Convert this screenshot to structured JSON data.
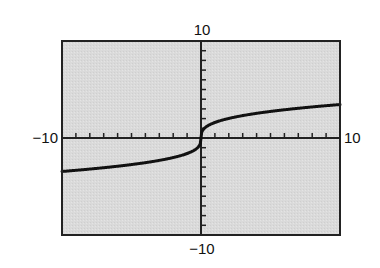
{
  "chart_data": {
    "type": "line",
    "title": "",
    "xlabel": "",
    "ylabel": "",
    "xlim": [
      -10,
      10
    ],
    "ylim": [
      -10,
      10
    ],
    "xscale_ticks": 1,
    "yscale_ticks": 1,
    "grid": false,
    "legend": null,
    "tick_labels": {
      "xmin": "−10",
      "xmax": "10",
      "ymin": "−10",
      "ymax": "10"
    },
    "series": [
      {
        "name": "f(x)",
        "description": "cube-root shaped increasing curve, approx y = 1.6·∛x",
        "x": [
          -10,
          -8,
          -6,
          -4,
          -3,
          -2,
          -1,
          -0.5,
          -0.2,
          -0.05,
          0,
          0.05,
          0.2,
          0.5,
          1,
          2,
          3,
          4,
          6,
          8,
          10
        ],
        "y": [
          -3.45,
          -3.2,
          -2.91,
          -2.54,
          -2.31,
          -2.02,
          -1.6,
          -1.27,
          -0.94,
          -0.59,
          0,
          0.59,
          0.94,
          1.27,
          1.6,
          2.02,
          2.31,
          2.54,
          2.91,
          3.2,
          3.45
        ]
      }
    ]
  },
  "colors": {
    "plot_background": "#d8d8d8",
    "frame": "#222222",
    "curve": "#111111",
    "axes": "#222222"
  },
  "layout": {
    "frame": {
      "left": 62,
      "top": 41,
      "right": 340,
      "bottom": 235
    }
  }
}
